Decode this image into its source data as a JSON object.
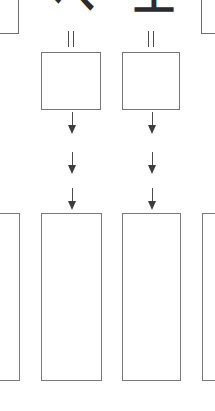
{
  "diagram": {
    "background_color": "#ffffff",
    "stroke_color": "#6e6e72",
    "glyph_color": "#2b2b2f",
    "arrow_color": "#3c3c41"
  },
  "top_partial_boxes": [
    {
      "name": "top-left-partial-box",
      "label": ""
    },
    {
      "name": "top-right-partial-box",
      "label": ""
    }
  ],
  "glyphs": [
    {
      "name": "handwritten-glyph-chevron",
      "text": "へ"
    },
    {
      "name": "handwritten-glyph-ko",
      "text": "工"
    }
  ],
  "connectors": [
    {
      "name": "double-line-connector-left",
      "style": "double-line"
    },
    {
      "name": "double-line-connector-right",
      "style": "double-line"
    }
  ],
  "square_boxes": [
    {
      "name": "square-box-left",
      "label": ""
    },
    {
      "name": "square-box-right",
      "label": ""
    }
  ],
  "arrow_rows": [
    {
      "row": 1,
      "arrows": [
        {
          "name": "arrow-down-col1-row1",
          "direction": "down"
        },
        {
          "name": "arrow-down-col2-row1",
          "direction": "down"
        }
      ]
    },
    {
      "row": 2,
      "arrows": [
        {
          "name": "arrow-down-col1-row2",
          "direction": "down"
        },
        {
          "name": "arrow-down-col2-row2",
          "direction": "down"
        }
      ]
    },
    {
      "row": 3,
      "arrows": [
        {
          "name": "arrow-down-col1-row3",
          "direction": "down"
        },
        {
          "name": "arrow-down-col2-row3",
          "direction": "down"
        }
      ]
    }
  ],
  "bottom_rectangles": [
    {
      "name": "bottom-rect-0-partial",
      "label": ""
    },
    {
      "name": "bottom-rect-1",
      "label": ""
    },
    {
      "name": "bottom-rect-2",
      "label": ""
    },
    {
      "name": "bottom-rect-3-partial",
      "label": ""
    }
  ]
}
